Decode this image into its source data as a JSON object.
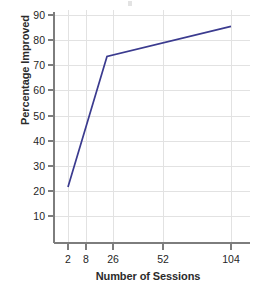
{
  "chart_data": {
    "type": "line",
    "title": "",
    "xlabel": "Number of Sessions",
    "ylabel": "Percentage Improved",
    "x": [
      2,
      20,
      104
    ],
    "values": [
      21.5,
      73.5,
      85.5
    ],
    "series": [
      {
        "name": "Percentage Improved",
        "points": [
          {
            "x": 2,
            "y": 21.5
          },
          {
            "x": 20,
            "y": 73.5
          },
          {
            "x": 104,
            "y": 85.5
          }
        ]
      }
    ],
    "xticks": [
      2,
      8,
      26,
      52,
      104
    ],
    "xtick_labels": [
      "2",
      "8",
      "26",
      "52",
      "104"
    ],
    "yticks": [
      10,
      20,
      30,
      40,
      50,
      60,
      70,
      80,
      90
    ],
    "ytick_labels": [
      "10",
      "20",
      "30",
      "40",
      "50",
      "60",
      "70",
      "80",
      "90"
    ],
    "ylim": [
      0,
      94
    ],
    "grid": true,
    "legend": "none",
    "line_color": "#3b3b8f",
    "grid_color": "#e2e2e2",
    "axis_color": "#7d7d7d",
    "background": "#ffffff"
  },
  "axes": {
    "y_title": "Percentage Improved",
    "x_title": "Number of Sessions",
    "y_tick_labels": [
      "90",
      "80",
      "70",
      "60",
      "50",
      "40",
      "30",
      "20",
      "10"
    ],
    "x_tick_labels": [
      "2",
      "8",
      "26",
      "52",
      "104"
    ]
  }
}
